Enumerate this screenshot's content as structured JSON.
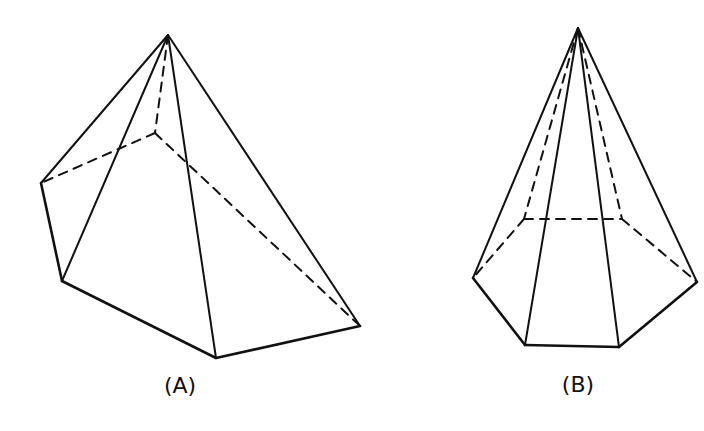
{
  "figures": [
    {
      "id": "A",
      "label": "(A)",
      "shape": "pentagonal pyramid (oblique)",
      "label_pos": [
        180,
        393
      ],
      "vertices": {
        "apex": [
          168,
          35
        ],
        "back": [
          155,
          133
        ],
        "left": [
          41,
          183
        ],
        "front_left": [
          62,
          281
        ],
        "bottom": [
          216,
          358
        ],
        "right": [
          360,
          326
        ]
      },
      "visible_edges": [
        [
          "apex",
          "left"
        ],
        [
          "apex",
          "front_left"
        ],
        [
          "apex",
          "bottom"
        ],
        [
          "apex",
          "right"
        ],
        [
          "left",
          "front_left"
        ],
        [
          "front_left",
          "bottom"
        ],
        [
          "bottom",
          "right"
        ]
      ],
      "hidden_edges": [
        [
          "apex",
          "back"
        ],
        [
          "back",
          "left"
        ],
        [
          "back",
          "right"
        ]
      ]
    },
    {
      "id": "B",
      "label": "(B)",
      "shape": "hexagonal pyramid",
      "label_pos": [
        578,
        392
      ],
      "vertices": {
        "apex": [
          578,
          28
        ],
        "back_left": [
          524,
          219
        ],
        "back_right": [
          622,
          219
        ],
        "left": [
          473,
          278
        ],
        "right": [
          697,
          282
        ],
        "front_left": [
          525,
          345
        ],
        "front_right": [
          619,
          347
        ]
      },
      "visible_edges": [
        [
          "apex",
          "left"
        ],
        [
          "apex",
          "front_left"
        ],
        [
          "apex",
          "front_right"
        ],
        [
          "apex",
          "right"
        ],
        [
          "left",
          "front_left"
        ],
        [
          "front_left",
          "front_right"
        ],
        [
          "front_right",
          "right"
        ]
      ],
      "hidden_edges": [
        [
          "apex",
          "back_left"
        ],
        [
          "apex",
          "back_right"
        ],
        [
          "back_left",
          "back_right"
        ],
        [
          "back_left",
          "left"
        ],
        [
          "back_right",
          "right"
        ]
      ]
    }
  ]
}
